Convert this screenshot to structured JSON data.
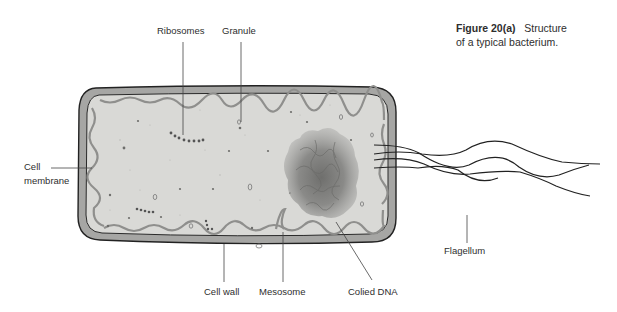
{
  "figure": {
    "caption_label": "Figure 20(a)",
    "caption_text": "Structure",
    "caption_line2": "of a typical bacterium."
  },
  "labels": {
    "ribosomes": "Ribosomes",
    "granule": "Granule",
    "cell_membrane_line1": "Cell",
    "cell_membrane_line2": "membrane",
    "cell_wall": "Cell wall",
    "mesosome": "Mesosome",
    "coiled_dna": "Colied DNA",
    "flagellum": "Flagellum"
  },
  "colors": {
    "background": "#ffffff",
    "cytoplasm": "#d9d9d6",
    "cell_wall": "#a6a6a4",
    "outline": "#222222",
    "membrane": "#8f8f8d",
    "dna": "#7d7d7b",
    "leader_line": "#444444"
  }
}
